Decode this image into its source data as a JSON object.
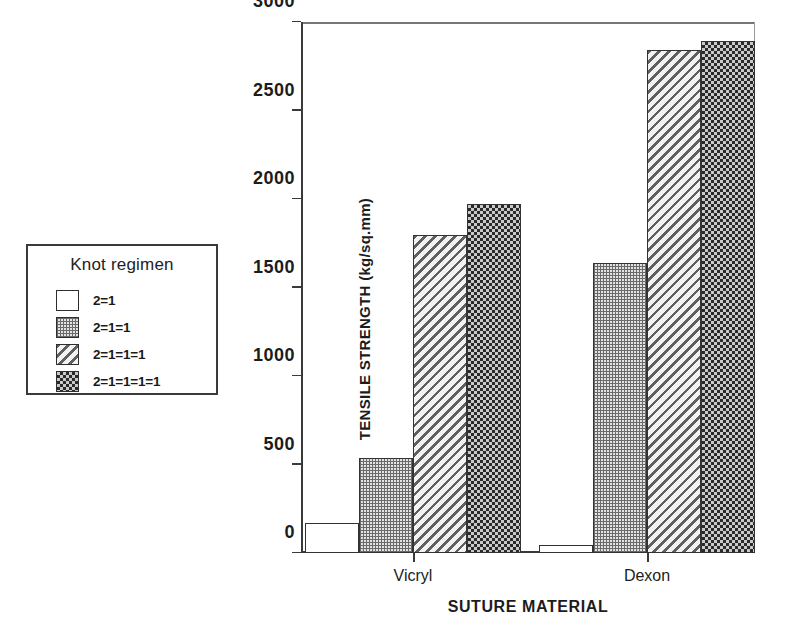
{
  "chart_data": {
    "type": "bar",
    "title": "",
    "xlabel": "SUTURE MATERIAL",
    "ylabel": "TENSILE STRENGTH (kg/sq.mm)",
    "categories": [
      "Vicryl",
      "Dexon"
    ],
    "ylim": [
      0,
      3000
    ],
    "yticks": [
      0,
      500,
      1000,
      1500,
      2000,
      2500,
      3000
    ],
    "ytick_labels": [
      "0",
      "500",
      "1000",
      "1500",
      "2000",
      "2500",
      "3000"
    ],
    "grid": false,
    "legend_position": "outside-left",
    "legend_title": "Knot regimen",
    "series": [
      {
        "name": "2=1",
        "pattern": "blank",
        "values": [
          170,
          45
        ]
      },
      {
        "name": "2=1=1",
        "pattern": "grid",
        "values": [
          535,
          1640
        ]
      },
      {
        "name": "2=1=1=1",
        "pattern": "hatch",
        "values": [
          1795,
          2840
        ]
      },
      {
        "name": "2=1=1=1=1",
        "pattern": "check",
        "values": [
          1970,
          2895
        ]
      }
    ]
  },
  "colors": {
    "axis": "#3a3a3a",
    "text": "#1c1c1c",
    "frame": "#9a9a9a",
    "bar_outline": "#333333"
  }
}
